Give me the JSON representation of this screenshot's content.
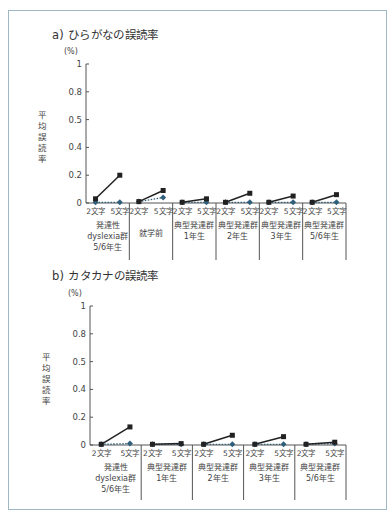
{
  "chart_data": [
    {
      "type": "line",
      "title": "a) ひらがなの誤読率",
      "ylabel": "平均誤読率",
      "yunit": "(%)",
      "ylim": [
        0,
        1
      ],
      "yticks": [
        "0",
        "0.2",
        "0.4",
        "0.5",
        "0.8",
        "1"
      ],
      "xtick_pair": [
        "2文字",
        "5文字"
      ],
      "groups": [
        {
          "label": [
            "発達性",
            "dyslexia群",
            "5/6年生"
          ],
          "series_a": [
            0.03,
            0.2
          ],
          "series_b": [
            0.005,
            0.005
          ]
        },
        {
          "label": [
            "就学前"
          ],
          "series_a": [
            0.01,
            0.09
          ],
          "series_b": [
            0.01,
            0.04
          ]
        },
        {
          "label": [
            "典型発達群",
            "1年生"
          ],
          "series_a": [
            0.005,
            0.03
          ],
          "series_b": [
            0.005,
            0.005
          ]
        },
        {
          "label": [
            "典型発達群",
            "2年生"
          ],
          "series_a": [
            0.005,
            0.07
          ],
          "series_b": [
            0.005,
            0.005
          ]
        },
        {
          "label": [
            "典型発達群",
            "3年生"
          ],
          "series_a": [
            0.005,
            0.05
          ],
          "series_b": [
            0.005,
            0.005
          ]
        },
        {
          "label": [
            "典型発達群",
            "5/6年生"
          ],
          "series_a": [
            0.005,
            0.06
          ],
          "series_b": [
            0.005,
            0.005
          ]
        }
      ],
      "series": [
        {
          "name": "solid-square",
          "style": "solid",
          "marker": "square",
          "color": "#222222"
        },
        {
          "name": "dotted-diamond",
          "style": "dotted",
          "marker": "diamond",
          "color": "#2f5f7a"
        }
      ],
      "grid": false
    },
    {
      "type": "line",
      "title": "b) カタカナの誤読率",
      "ylabel": "平均誤読率",
      "yunit": "(%)",
      "ylim": [
        0,
        1
      ],
      "yticks": [
        "0",
        "0.2",
        "0.4",
        "0.5",
        "0.8",
        "1"
      ],
      "xtick_pair": [
        "2文字",
        "5文字"
      ],
      "groups": [
        {
          "label": [
            "発達性",
            "dyslexia群",
            "5/6年生"
          ],
          "series_a": [
            0.005,
            0.13
          ],
          "series_b": [
            0.005,
            0.01
          ]
        },
        {
          "label": [
            "典型発達群",
            "1年生"
          ],
          "series_a": [
            0.005,
            0.01
          ],
          "series_b": [
            0.005,
            0.005
          ]
        },
        {
          "label": [
            "典型発達群",
            "2年生"
          ],
          "series_a": [
            0.005,
            0.07
          ],
          "series_b": [
            0.005,
            0.005
          ]
        },
        {
          "label": [
            "典型発達群",
            "3年生"
          ],
          "series_a": [
            0.005,
            0.06
          ],
          "series_b": [
            0.005,
            0.005
          ]
        },
        {
          "label": [
            "典型発達群",
            "5/6年生"
          ],
          "series_a": [
            0.005,
            0.02
          ],
          "series_b": [
            0.005,
            0.01
          ]
        }
      ],
      "series": [
        {
          "name": "solid-square",
          "style": "solid",
          "marker": "square",
          "color": "#222222"
        },
        {
          "name": "dotted-diamond",
          "style": "dotted",
          "marker": "diamond",
          "color": "#2f5f7a"
        }
      ],
      "grid": false
    }
  ],
  "colors": {
    "frame": "#9fb8c4",
    "axis": "#555555",
    "series_a": "#222222",
    "series_b": "#2f5f7a"
  }
}
